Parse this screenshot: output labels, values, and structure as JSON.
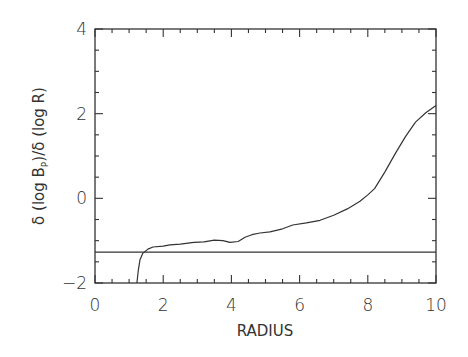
{
  "chart_data": {
    "type": "line",
    "title": "",
    "xlabel": "RADIUS",
    "ylabel_parts": {
      "prefix": "δ (log B",
      "sub": "P",
      "suffix": ")/δ (log R)"
    },
    "xlim": [
      0,
      10
    ],
    "ylim": [
      -2,
      4
    ],
    "xticks": [
      0,
      2,
      4,
      6,
      8,
      10
    ],
    "yticks": [
      -2,
      0,
      2,
      4
    ],
    "x_minor_step": 0.5,
    "y_minor_step": 0.5,
    "grid": false,
    "legend": null,
    "series": [
      {
        "name": "profile",
        "x": [
          1.23,
          1.27,
          1.32,
          1.4,
          1.55,
          1.7,
          2.0,
          2.2,
          2.5,
          2.9,
          3.2,
          3.5,
          3.75,
          3.96,
          4.2,
          4.4,
          4.6,
          4.84,
          5.13,
          5.5,
          5.8,
          6.2,
          6.6,
          7.0,
          7.4,
          7.77,
          8.0,
          8.2,
          8.5,
          8.8,
          9.1,
          9.4,
          9.7,
          10.0
        ],
        "y": [
          -2.0,
          -1.7,
          -1.45,
          -1.3,
          -1.2,
          -1.15,
          -1.13,
          -1.1,
          -1.08,
          -1.04,
          -1.03,
          -0.99,
          -1.0,
          -1.04,
          -1.02,
          -0.92,
          -0.86,
          -0.82,
          -0.79,
          -0.72,
          -0.63,
          -0.58,
          -0.52,
          -0.4,
          -0.25,
          -0.07,
          0.08,
          0.23,
          0.62,
          1.05,
          1.45,
          1.8,
          2.02,
          2.19
        ]
      },
      {
        "name": "reference-line",
        "x": [
          0,
          10
        ],
        "y": [
          -1.27,
          -1.27
        ]
      }
    ]
  },
  "plot_area": {
    "left": 95,
    "right": 436,
    "top": 29,
    "bottom": 283
  },
  "colors": {
    "axis": "#333333",
    "line": "#333333"
  }
}
